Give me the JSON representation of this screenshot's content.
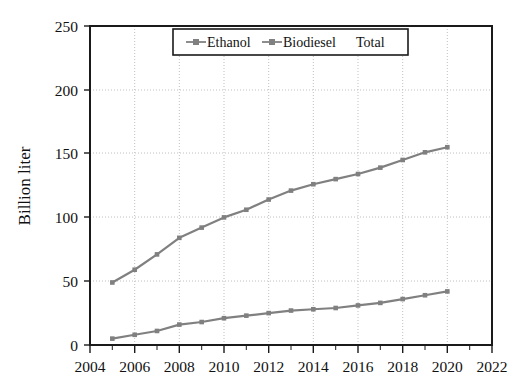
{
  "chart_data": {
    "type": "line",
    "title": "",
    "xlabel": "",
    "ylabel": "Billion liter",
    "xlim": [
      2004,
      2022
    ],
    "ylim": [
      0,
      250
    ],
    "xticks": [
      2004,
      2006,
      2008,
      2010,
      2012,
      2014,
      2016,
      2018,
      2020,
      2022
    ],
    "yticks": [
      0,
      50,
      100,
      150,
      200,
      250
    ],
    "grid": true,
    "legend_position": "top-center",
    "x": [
      2005,
      2006,
      2007,
      2008,
      2009,
      2010,
      2011,
      2012,
      2013,
      2014,
      2015,
      2016,
      2017,
      2018,
      2019,
      2020
    ],
    "series": [
      {
        "name": "Total",
        "color": "#808080",
        "marker": "square",
        "values": [
          49,
          59,
          71,
          84,
          92,
          100,
          106,
          114,
          121,
          126,
          130,
          134,
          139,
          145,
          151,
          155
        ]
      },
      {
        "name": "Ethanol",
        "color": "#808080",
        "marker": "square",
        "values": [
          5,
          8,
          11,
          16,
          18,
          21,
          23,
          25,
          27,
          28,
          29,
          31,
          33,
          36,
          39,
          42
        ]
      }
    ],
    "legend_entries": [
      {
        "label": "Ethanol",
        "marker": "line-square",
        "color": "#808080"
      },
      {
        "label": "Biodiesel",
        "marker": "line-square",
        "color": "#808080"
      },
      {
        "label": "Total",
        "marker": "none",
        "color": "#808080"
      }
    ]
  },
  "axes": {
    "y_axis_title": "Billion liter",
    "y_tick_labels": [
      "250",
      "200",
      "150",
      "100",
      "50",
      "0"
    ],
    "x_tick_labels": [
      "2004",
      "2006",
      "2008",
      "2010",
      "2012",
      "2014",
      "2016",
      "2018",
      "2020",
      "2022"
    ]
  },
  "legend": {
    "items": [
      "Ethanol",
      "Biodiesel",
      "Total"
    ]
  },
  "colors": {
    "line": "#808080",
    "frame": "#1a1a1a",
    "grid": "#c8c8c8",
    "background": "#ffffff"
  }
}
